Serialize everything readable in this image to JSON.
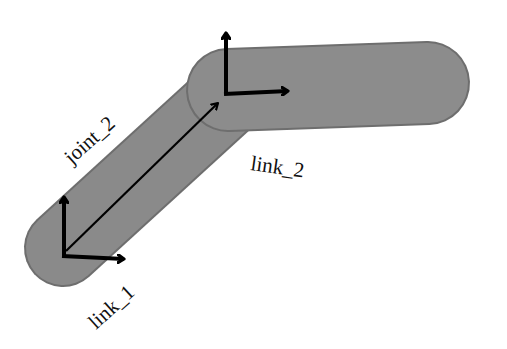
{
  "diagram": {
    "colors": {
      "link_fill": "#8a8a8a",
      "link_stroke": "#6e6e6e",
      "arrow": "#000000",
      "background": "#ffffff"
    },
    "links": [
      {
        "id": "link_1",
        "label": "link_1"
      },
      {
        "id": "link_2",
        "label": "link_2"
      }
    ],
    "joints": [
      {
        "id": "joint_2",
        "label": "joint_2"
      }
    ],
    "frames": [
      {
        "id": "frame-1",
        "at": "link_1 base"
      },
      {
        "id": "frame-2",
        "at": "joint_2"
      }
    ]
  }
}
